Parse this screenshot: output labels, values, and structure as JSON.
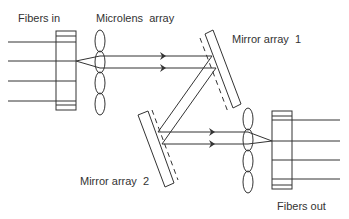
{
  "diagram": {
    "labels": {
      "fibers_in": "Fibers in",
      "microlens_array": "Microlens  array",
      "mirror_array_1": "Mirror array  1",
      "mirror_array_2": "Mirror array  2",
      "fibers_out": "Fibers out"
    },
    "colors": {
      "stroke": "#333333",
      "text": "#333333",
      "background": "#ffffff"
    },
    "components": [
      "input-fiber-array",
      "input-microlens-array",
      "mirror-array-1",
      "mirror-array-2",
      "output-microlens-array",
      "output-fiber-array"
    ],
    "fiber_count_in": 4,
    "fiber_count_out": 4,
    "lens_count_per_array": 4
  }
}
